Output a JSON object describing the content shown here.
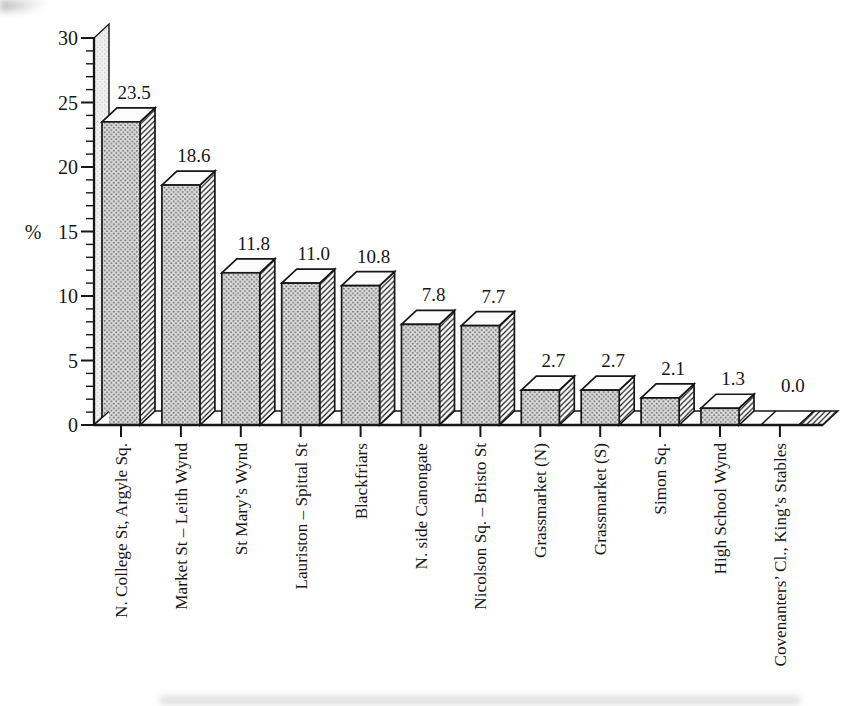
{
  "figure": {
    "background": "#ffffff",
    "ink_color": "#161616"
  },
  "chart_data": {
    "type": "bar",
    "effect": "3d-offset-block-bars",
    "title": "",
    "xlabel": "",
    "ylabel": "%",
    "ylim": [
      0,
      30
    ],
    "yticks": [
      0,
      5,
      10,
      15,
      20,
      25,
      30
    ],
    "minor_tick_step": 1,
    "grid": false,
    "legend": false,
    "category_label_rotation": -90,
    "categories": [
      "N. College St, Argyle Sq.",
      "Market St – Leith Wynd",
      "St Mary’s Wynd",
      "Lauriston – Spittal St",
      "Blackfriars",
      "N. side Canongate",
      "Nicolson Sq. – Bristo St",
      "Grassmarket (N)",
      "Grassmarket (S)",
      "Simon Sq.",
      "High School Wynd",
      "Covenanters’ Cl., King’s Stables"
    ],
    "values": [
      23.5,
      18.6,
      11.8,
      11.0,
      10.8,
      7.8,
      7.7,
      2.7,
      2.7,
      2.1,
      1.3,
      0.0
    ],
    "data_labels": [
      "23.5",
      "18.6",
      "11.8",
      "11.0",
      "10.8",
      "7.8",
      "7.7",
      "2.7",
      "2.7",
      "2.1",
      "1.3",
      "0.0"
    ],
    "colors": {
      "ink": "#161616",
      "bar_front_base": "#dcdcdc",
      "bar_front_dot": "#6e6e6e",
      "bar_side_fill": "#ffffff",
      "bar_side_hatch": "#1a1a1a",
      "bar_top": "#fcfcfc",
      "axis_wall_base": "#f1f1f1",
      "axis_wall_dot": "#c9c9c9",
      "floor": "#ffffff"
    }
  }
}
